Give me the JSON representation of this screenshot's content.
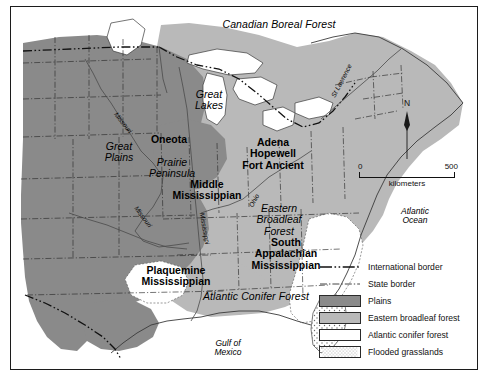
{
  "figure": {
    "frame_border_color": "#1c1c1c",
    "background": "#ffffff"
  },
  "palette": {
    "plains": "#8a8a8a",
    "eastern_broadleaf_forest": "#b9b9b9",
    "atlantic_conifer_forest": "#ffffff",
    "flooded_grasslands": "#ffffff",
    "water": "#ffffff",
    "coastline": "#3a3a3a",
    "state_border": "#2b2b2b",
    "international_border": "#111111",
    "text": "#000000"
  },
  "vegetation_labels": [
    {
      "name": "canadian-boreal-forest",
      "text": "Canadian Boreal Forest",
      "style": "italic",
      "x": 268,
      "y": 18
    },
    {
      "name": "eastern-broadleaf-forest",
      "text": "Eastern\nBroadleaf\nForest",
      "style": "italic",
      "x": 268,
      "y": 207
    },
    {
      "name": "atlantic-conifer-forest",
      "text": "Atlantic Conifer Forest",
      "style": "italic",
      "x": 245,
      "y": 293
    }
  ],
  "physiographic_labels": [
    {
      "name": "great-plains",
      "text": "Great\nPlains",
      "style": "italic",
      "x": 108,
      "y": 142
    },
    {
      "name": "great-lakes",
      "text": "Great\nLakes",
      "style": "italic",
      "x": 198,
      "y": 89
    },
    {
      "name": "prairie-peninsula",
      "text": "Prairie\nPeninsula",
      "style": "italic",
      "x": 161,
      "y": 158
    }
  ],
  "water_labels": [
    {
      "name": "atlantic-ocean",
      "text": "Atlantic\nOcean",
      "style": "italic",
      "x": 404,
      "y": 208
    },
    {
      "name": "gulf-of-mexico",
      "text": "Gulf of\nMexico",
      "style": "italic",
      "x": 217,
      "y": 340
    }
  ],
  "river_labels": [
    {
      "name": "missouri-river-upper",
      "text": "Missouri",
      "rotation": 52,
      "x": 107,
      "y": 118
    },
    {
      "name": "missouri-river-lower",
      "text": "Missouri",
      "rotation": 53,
      "x": 128,
      "y": 213
    },
    {
      "name": "mississippi-river",
      "text": "Mississippi",
      "rotation": 80,
      "x": 192,
      "y": 224
    },
    {
      "name": "ohio-river",
      "text": "Ohio",
      "rotation": -62,
      "x": 243,
      "y": 195
    },
    {
      "name": "st-lawrence-river",
      "text": "St Lawrence",
      "rotation": -62,
      "x": 328,
      "y": 78
    },
    {
      "name": "arkansas-river",
      "text": "Arkansas",
      "rotation": 57,
      "x": 130,
      "y": 212
    }
  ],
  "culture_labels": [
    {
      "name": "oneota",
      "text": "Oneota",
      "x": 158,
      "y": 134
    },
    {
      "name": "adena-hopewell-fort-ancient",
      "text": "Adena\nHopewell\nFort Ancient",
      "x": 262,
      "y": 143
    },
    {
      "name": "middle-mississippian",
      "text": "Middle\nMississippian",
      "x": 196,
      "y": 180
    },
    {
      "name": "south-appalachian-mississippian",
      "text": "South\nAppalachian\nMississippian",
      "x": 275,
      "y": 243
    },
    {
      "name": "plaquemine-mississippian",
      "text": "Plaquemine\nMississippian",
      "x": 165,
      "y": 267
    }
  ],
  "north_arrow": {
    "label": "N"
  },
  "scale_bar": {
    "min_label": "0",
    "max_label": "500",
    "units_label": "kilometers"
  },
  "legend": {
    "items": [
      {
        "name": "international-border",
        "label": "International border",
        "key": "dash-dot-dot-line",
        "color": "#111111"
      },
      {
        "name": "state-border",
        "label": "State border",
        "key": "dash-dot-line",
        "color": "#555555"
      },
      {
        "name": "plains",
        "label": "Plains",
        "key": "swatch",
        "color": "#8a8a8a"
      },
      {
        "name": "eastern-broadleaf-forest",
        "label": "Eastern broadleaf forest",
        "key": "swatch",
        "color": "#b9b9b9"
      },
      {
        "name": "atlantic-conifer-forest",
        "label": "Atlantic conifer forest",
        "key": "swatch",
        "color": "#ffffff"
      },
      {
        "name": "flooded-grasslands",
        "label": "Flooded grasslands",
        "key": "swatch-dotted",
        "color": "#ffffff"
      }
    ]
  }
}
